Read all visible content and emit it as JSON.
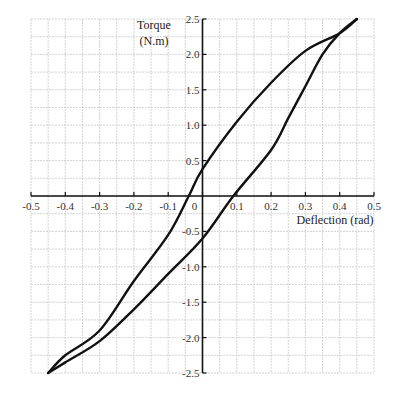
{
  "chart_data": {
    "type": "line",
    "title": "",
    "xlabel": "Deflection (rad)",
    "ylabel_line1": "Torque",
    "ylabel_line2": "(N.m)",
    "xlim": [
      -0.5,
      0.5
    ],
    "ylim": [
      -2.5,
      2.5
    ],
    "grid": true,
    "x_ticks": [
      "-0.5",
      "-0.4",
      "-0.3",
      "-0.2",
      "-0.1",
      "0",
      "0.1",
      "0.2",
      "0.3",
      "0.4",
      "0.5"
    ],
    "y_ticks": [
      "2.5",
      "2.0",
      "1.5",
      "1.0",
      "0.5",
      "-0.5",
      "-1.0",
      "-1.5",
      "-2.0",
      "-2.5"
    ],
    "series": [
      {
        "name": "upper branch (unloading)",
        "x": [
          0.45,
          0.4,
          0.3,
          0.2,
          0.1,
          0.0,
          -0.04,
          -0.1,
          -0.2,
          -0.3,
          -0.4,
          -0.45
        ],
        "y": [
          2.5,
          2.3,
          2.05,
          1.6,
          1.05,
          0.38,
          0.0,
          -0.55,
          -1.2,
          -1.9,
          -2.25,
          -2.5
        ]
      },
      {
        "name": "lower branch (loading)",
        "x": [
          -0.45,
          -0.4,
          -0.3,
          -0.2,
          -0.1,
          0.0,
          0.09,
          0.2,
          0.25,
          0.3,
          0.35,
          0.4,
          0.45
        ],
        "y": [
          -2.5,
          -2.35,
          -2.05,
          -1.6,
          -1.1,
          -0.6,
          0.0,
          0.65,
          1.1,
          1.55,
          2.0,
          2.3,
          2.5
        ]
      }
    ],
    "legend": null
  }
}
